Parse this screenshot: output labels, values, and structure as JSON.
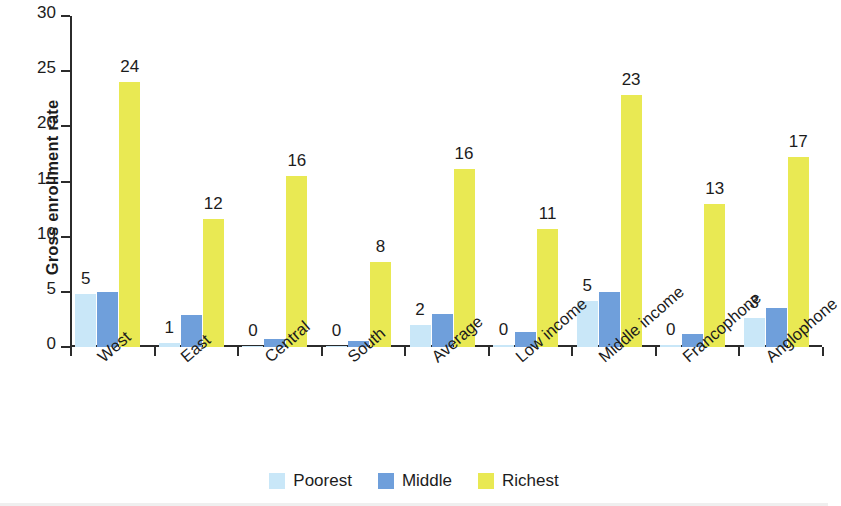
{
  "chart_data": {
    "type": "bar",
    "title": "",
    "xlabel": "",
    "ylabel": "Gross enrollment rate",
    "ylim": [
      0,
      30
    ],
    "yticks": [
      0,
      5,
      10,
      15,
      20,
      25,
      30
    ],
    "grid": false,
    "legend_position": "bottom",
    "categories": [
      "West",
      "East",
      "Central",
      "South",
      "Average",
      "Low income",
      "Middle income",
      "Francophone",
      "Anglophone"
    ],
    "series": [
      {
        "name": "Poorest",
        "color": "#c9e7f8",
        "values": [
          4.8,
          0.35,
          0.1,
          0.1,
          2.0,
          0.15,
          4.2,
          0.15,
          2.6
        ],
        "labels": [
          "5",
          "1",
          "0",
          "0",
          "2",
          "0",
          "5",
          "0",
          "3"
        ]
      },
      {
        "name": "Middle",
        "color": "#6f9fdb",
        "values": [
          5.0,
          2.9,
          0.7,
          0.55,
          3.0,
          1.4,
          5.0,
          1.2,
          3.5
        ],
        "labels": [
          "",
          "",
          "",
          "",
          "",
          "",
          "",
          "",
          ""
        ]
      },
      {
        "name": "Richest",
        "color": "#e9e953",
        "values": [
          24.0,
          11.6,
          15.5,
          7.7,
          16.1,
          10.7,
          22.8,
          13.0,
          17.2
        ],
        "labels": [
          "24",
          "12",
          "16",
          "8",
          "16",
          "11",
          "23",
          "13",
          "17"
        ]
      }
    ]
  },
  "legend": {
    "items": [
      {
        "label": "Poorest",
        "color": "#c9e7f8"
      },
      {
        "label": "Middle",
        "color": "#6f9fdb"
      },
      {
        "label": "Richest",
        "color": "#e9e953"
      }
    ]
  },
  "axis": {
    "y_title": "Gross enrollment rate"
  }
}
